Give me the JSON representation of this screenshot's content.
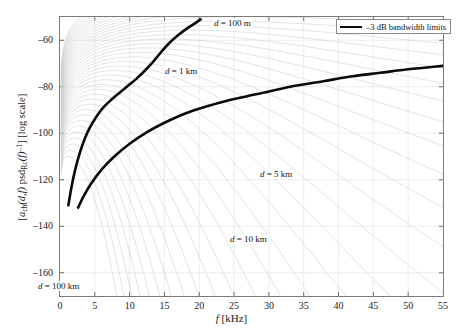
{
  "figure": {
    "background": "#ffffff",
    "frame_color": "#7a7a7a"
  },
  "legend": {
    "label": "–3 dB bandwidth limits",
    "swatch_color": "#0a0a0a",
    "position": "top-right"
  },
  "axes": {
    "x": {
      "title_symbol": "f",
      "title_unit": "[kHz]",
      "ticks": [
        0,
        5,
        10,
        15,
        20,
        25,
        30,
        35,
        40,
        45,
        50,
        55
      ],
      "tick_labels": [
        "0",
        "5",
        "10",
        "15",
        "20",
        "25",
        "30",
        "35",
        "40",
        "45",
        "50",
        "55"
      ],
      "min": 0,
      "max": 55
    },
    "y": {
      "title_parts": {
        "open": "[",
        "a": "a",
        "a_sub": "ch",
        "args": "(d,f)",
        "psd": "psd",
        "psd_sub": "Rc",
        "f": "(f)",
        "exp": "–1",
        "close": "] [log scale]"
      },
      "title_plain": "[a_ch(d,f) psd_Rc(f)]^-1 [log scale]",
      "ticks": [
        -60,
        -80,
        -100,
        -120,
        -140,
        -160
      ],
      "tick_labels": [
        "–60",
        "–80",
        "–100",
        "–120",
        "–140",
        "–160"
      ],
      "min": -170,
      "max": -50
    }
  },
  "annotations": [
    {
      "text": "d = 100 m",
      "x_px": 212,
      "y_px": 18,
      "name": "label-d-100m"
    },
    {
      "text": "d = 1 km",
      "x_px": 163,
      "y_px": 66,
      "name": "label-d-1km"
    },
    {
      "text": "d = 5 km",
      "x_px": 258,
      "y_px": 169,
      "name": "label-d-5km"
    },
    {
      "text": "d = 10 km",
      "x_px": 228,
      "y_px": 234,
      "name": "label-d-10km"
    },
    {
      "text": "d = 100 km",
      "x_px": 36,
      "y_px": 281,
      "name": "label-d-100km"
    }
  ],
  "chart_data": {
    "type": "line",
    "title": "",
    "xlabel": "f [kHz]",
    "ylabel": "[a_ch(d,f) psd_Rc(f)]^-1 [log scale]",
    "xlim": [
      0,
      55
    ],
    "ylim": [
      -170,
      -50
    ],
    "grid": true,
    "grid_color": "#e0e0e0",
    "family_curves": {
      "color": "#c9c9c9",
      "count": 40,
      "distance_range_m": [
        100,
        100000
      ],
      "labelled_distances": [
        "100 m",
        "1 km",
        "5 km",
        "10 km",
        "100 km"
      ],
      "note": "Each faint curve rises steeply at low f, peaks, then falls off; peak frequency and peak level decrease as d increases."
    },
    "series": [
      {
        "name": "-3 dB bandwidth limits (upper edge)",
        "color": "#0a0a0a",
        "width": 2.6,
        "points": [
          [
            1.2,
            -131.0
          ],
          [
            1.6,
            -124.0
          ],
          [
            2.0,
            -118.0
          ],
          [
            2.5,
            -112.0
          ],
          [
            3.0,
            -107.0
          ],
          [
            3.6,
            -102.0
          ],
          [
            4.3,
            -97.5
          ],
          [
            5.2,
            -93.0
          ],
          [
            6.2,
            -89.0
          ],
          [
            7.4,
            -85.5
          ],
          [
            8.6,
            -82.5
          ],
          [
            9.8,
            -79.5
          ],
          [
            11.0,
            -76.5
          ],
          [
            12.2,
            -73.0
          ],
          [
            13.3,
            -69.5
          ],
          [
            14.4,
            -65.5
          ],
          [
            15.6,
            -61.5
          ],
          [
            16.9,
            -58.0
          ],
          [
            18.2,
            -55.0
          ],
          [
            19.5,
            -52.5
          ],
          [
            20.2,
            -51.0
          ]
        ]
      },
      {
        "name": "-3 dB bandwidth limits (lower edge)",
        "color": "#0a0a0a",
        "width": 2.6,
        "points": [
          [
            2.6,
            -132.0
          ],
          [
            3.4,
            -127.0
          ],
          [
            4.5,
            -121.5
          ],
          [
            6.0,
            -115.5
          ],
          [
            7.8,
            -110.0
          ],
          [
            10.0,
            -104.5
          ],
          [
            12.5,
            -99.5
          ],
          [
            15.0,
            -95.5
          ],
          [
            18.0,
            -91.5
          ],
          [
            21.0,
            -88.5
          ],
          [
            24.0,
            -86.0
          ],
          [
            27.0,
            -84.0
          ],
          [
            30.0,
            -82.0
          ],
          [
            34.0,
            -79.5
          ],
          [
            38.0,
            -77.5
          ],
          [
            42.0,
            -75.5
          ],
          [
            46.0,
            -74.0
          ],
          [
            50.0,
            -72.5
          ],
          [
            55.0,
            -71.0
          ]
        ]
      }
    ]
  }
}
